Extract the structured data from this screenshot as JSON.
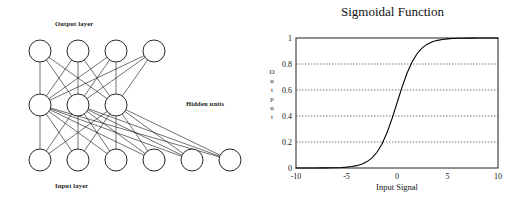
{
  "figure": {
    "background_color": "#ffffff",
    "ink_color": "#000000"
  },
  "network": {
    "title_output": "Output layer",
    "title_input": "Input layer",
    "title_hidden": "Hidden units",
    "layers": [
      {
        "name": "output",
        "node_count": 4,
        "cx": [
          40,
          78,
          116,
          154
        ],
        "cy": 51,
        "r": 11
      },
      {
        "name": "hidden",
        "node_count": 3,
        "cx": [
          40,
          78,
          116
        ],
        "cy": 105,
        "r": 11
      },
      {
        "name": "input",
        "node_count": 6,
        "cx": [
          40,
          78,
          116,
          154,
          192,
          230
        ],
        "cy": 160,
        "r": 11
      }
    ],
    "node_stroke": "#111111",
    "node_fill": "#ffffff",
    "edge_color": "#111111",
    "fully_connected": true
  },
  "chart_data": {
    "type": "line",
    "title": "Sigmoidal Function",
    "xlabel": "Input Signal",
    "ylabel": "Output",
    "ylabel_letters": [
      "O",
      "u",
      "t",
      "p",
      "u",
      "t"
    ],
    "xlim": [
      -10,
      10
    ],
    "ylim": [
      0,
      1
    ],
    "xticks": [
      -10,
      -5,
      0,
      5,
      10
    ],
    "xtick_labels": [
      "-10",
      "-5",
      "0",
      "5",
      "10"
    ],
    "yticks": [
      0,
      0.2,
      0.4,
      0.6,
      0.8,
      1
    ],
    "ytick_labels": [
      "0",
      "0.2",
      "0.4",
      "0.6",
      "0.8",
      "1"
    ],
    "grid": "horizontal-dotted",
    "gridlines_at": [
      0.2,
      0.4,
      0.6,
      0.8
    ],
    "legend": null,
    "series": [
      {
        "name": "sigmoid",
        "formula": "1 / (1 + exp(-x))",
        "color": "#000000",
        "x": [
          -10,
          -9.5,
          -9,
          -8.5,
          -8,
          -7.5,
          -7,
          -6.5,
          -6,
          -5.5,
          -5,
          -4.5,
          -4,
          -3.5,
          -3,
          -2.5,
          -2,
          -1.5,
          -1,
          -0.5,
          0,
          0.5,
          1,
          1.5,
          2,
          2.5,
          3,
          3.5,
          4,
          4.5,
          5,
          5.5,
          6,
          6.5,
          7,
          7.5,
          8,
          8.5,
          9,
          9.5,
          10
        ],
        "y": [
          0.0,
          0.0001,
          0.0001,
          0.0002,
          0.0003,
          0.0006,
          0.0009,
          0.0015,
          0.0025,
          0.0041,
          0.0067,
          0.011,
          0.018,
          0.0293,
          0.0474,
          0.0759,
          0.1192,
          0.1824,
          0.2689,
          0.3775,
          0.5,
          0.6225,
          0.7311,
          0.8176,
          0.8808,
          0.9241,
          0.9526,
          0.9707,
          0.982,
          0.989,
          0.9933,
          0.9959,
          0.9975,
          0.9985,
          0.9991,
          0.9994,
          0.9997,
          0.9998,
          0.9999,
          0.9999,
          1.0
        ]
      }
    ]
  }
}
